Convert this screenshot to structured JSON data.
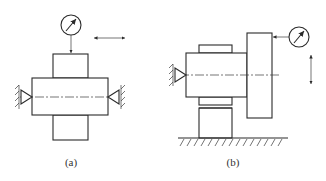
{
  "figure": {
    "panels": [
      {
        "id": "a",
        "caption": "(a)",
        "components": [
          "dial-indicator",
          "shaft-between-centers",
          "hatched-collar",
          "left-center",
          "right-center",
          "horizontal-motion-arrow"
        ]
      },
      {
        "id": "b",
        "caption": "(b)",
        "components": [
          "dial-indicator",
          "shaft",
          "disc-face",
          "key",
          "support-block",
          "ground",
          "left-center",
          "vertical-motion-arrow"
        ]
      }
    ],
    "colors": {
      "line": "#2a2a2a",
      "background": "#ffffff"
    }
  }
}
